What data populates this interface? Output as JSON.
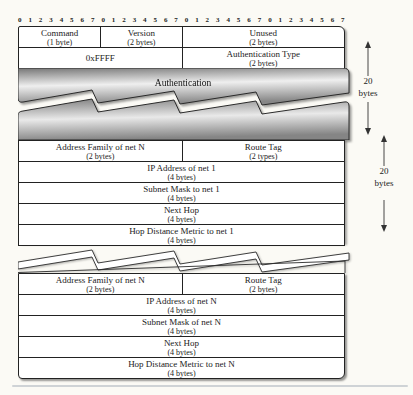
{
  "ruler": {
    "numbers": [
      "0",
      "1",
      "2",
      "3",
      "4",
      "5",
      "6",
      "7"
    ],
    "repeat": 4
  },
  "header": {
    "row1": [
      {
        "label": "Command",
        "size": "(1 byte)"
      },
      {
        "label": "Version",
        "size": "(2 bytes)"
      },
      {
        "label": "Unused",
        "size": "(2 bytes)"
      }
    ],
    "row2": [
      {
        "label": "0xFFFF",
        "size": ""
      },
      {
        "label": "Authentication Type",
        "size": "(2 bytes)"
      }
    ]
  },
  "auth_band": {
    "label": "Authentication"
  },
  "entry1": {
    "row1": {
      "left": {
        "label": "Address Family of net N",
        "size": "(2 bytes)"
      },
      "right": {
        "label": "Route Tag",
        "size": "(2 types)"
      }
    },
    "rows": [
      {
        "label": "IP Address of net 1",
        "size": "(4 bytes)"
      },
      {
        "label": "Subnet Mask to net 1",
        "size": "(4 bytes)"
      },
      {
        "label": "Next Hop",
        "size": "(4 bytes)"
      },
      {
        "label": "Hop Distance Metric to net 1",
        "size": "(4 bytes)"
      }
    ]
  },
  "entryN": {
    "row1": {
      "left": {
        "label": "Address Family of net N",
        "size": "(2 bytes)"
      },
      "right": {
        "label": "Route Tag",
        "size": "(2 bytes)"
      }
    },
    "rows": [
      {
        "label": "IP Address of net N",
        "size": "(4 bytes)"
      },
      {
        "label": "Subnet Mask of net N",
        "size": "(4 bytes)"
      },
      {
        "label": "Next Hop",
        "size": "(4 bytes)"
      },
      {
        "label": "Hop Distance Metric to net N",
        "size": "(4 bytes)"
      }
    ]
  },
  "annotations": {
    "arrow1": {
      "value": "20",
      "unit": "bytes"
    },
    "arrow2": {
      "value": "20",
      "unit": "bytes"
    }
  },
  "colors": {
    "band_dark": "#777777",
    "band_light": "#efefef",
    "border": "#222222",
    "divider": "#cfd3d6"
  }
}
